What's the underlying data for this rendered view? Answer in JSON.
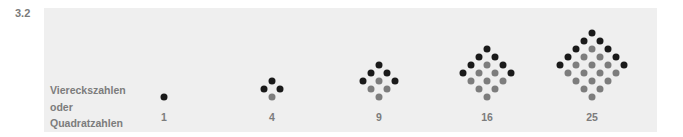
{
  "figure": {
    "number": "3.2",
    "label_lines": [
      "Viereckszahlen",
      "oder",
      "Quadratzahlen"
    ]
  },
  "colors": {
    "panel": "#efefef",
    "edge_dot": "#1a1a1a",
    "inner_dot": "#7d7d7d",
    "text": "#7c7c7c"
  },
  "square_numbers": [
    {
      "n": 1,
      "label": "1",
      "center_x": 164
    },
    {
      "n": 2,
      "label": "4",
      "center_x": 272
    },
    {
      "n": 3,
      "label": "9",
      "center_x": 379
    },
    {
      "n": 4,
      "label": "16",
      "center_x": 487
    },
    {
      "n": 5,
      "label": "25",
      "center_x": 592
    }
  ]
}
